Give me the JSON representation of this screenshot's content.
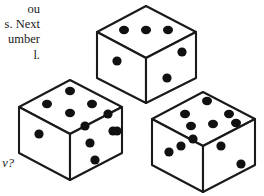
{
  "page": {
    "background_color": "#ffffff",
    "width": 264,
    "height": 196,
    "ink_color": "#1a1a1a",
    "pip_color": "#111111"
  },
  "text": {
    "paragraph_lines": [
      "ou",
      "s. Next",
      "umber",
      "l."
    ],
    "question_fragment": "v?"
  },
  "dice": [
    {
      "id": "die-top",
      "position": "top-center",
      "faces": {
        "top": {
          "pips": 3,
          "arrangement": "row-of-three"
        },
        "left": {
          "pips": 1,
          "arrangement": "center"
        },
        "right": {
          "pips": 2,
          "arrangement": "diagonal"
        }
      }
    },
    {
      "id": "die-left",
      "position": "bottom-left",
      "faces": {
        "top": {
          "pips": 5,
          "arrangement": "quincunx"
        },
        "left": {
          "pips": 1,
          "arrangement": "center"
        },
        "right": {
          "pips": 6,
          "arrangement": "two-columns-of-three"
        }
      }
    },
    {
      "id": "die-right",
      "position": "bottom-right",
      "faces": {
        "top": {
          "pips": 6,
          "arrangement": "two-rows-of-three"
        },
        "left": {
          "pips": 3,
          "arrangement": "diagonal"
        },
        "right": {
          "pips": 2,
          "arrangement": "diagonal"
        }
      }
    }
  ],
  "geometry": {
    "die_top": {
      "top_face": "146,6 196,32 146,58 97,32",
      "left_face": "97,32 146,58 146,103 97,78",
      "right_face": "146,58 196,32 196,78 146,103",
      "top_pips": [
        [
          124,
          30
        ],
        [
          146,
          30
        ],
        [
          168,
          30
        ]
      ],
      "left_pips": [
        [
          116,
          60
        ]
      ],
      "right_pips": [
        [
          181,
          52
        ],
        [
          167,
          77
        ]
      ]
    },
    "die_left": {
      "top_face": "70,80 122,107 70,134 19,107",
      "left_face": "19,107 70,134 70,180 19,153",
      "right_face": "70,134 122,107 122,153 70,180",
      "top_pips": [
        [
          70,
          91
        ],
        [
          48,
          104
        ],
        [
          92,
          104
        ],
        [
          70,
          117
        ],
        [
          48,
          117
        ]
      ],
      "left_pips": [
        [
          39,
          133
        ]
      ],
      "right_pips": [
        [
          84,
          126
        ],
        [
          107,
          115
        ],
        [
          89,
          143
        ],
        [
          112,
          132
        ],
        [
          94,
          160
        ],
        [
          117,
          149
        ]
      ]
    },
    "die_right": {
      "top_face": "203,92 255,119 203,146 152,119]",
      "left_face": "152,119 203,146 203,192 152,165",
      "right_face": "203,146 255,119 255,165 203,192",
      "top_pips": [
        [
          206,
          100
        ],
        [
          184,
          113
        ],
        [
          228,
          113
        ],
        [
          213,
          124
        ],
        [
          191,
          137
        ],
        [
          235,
          124
        ]
      ],
      "left_pips": [
        [
          171,
          149
        ],
        [
          182,
          143
        ],
        [
          193,
          137
        ]
      ],
      "right_pips": [
        [
          221,
          146
        ],
        [
          240,
          163
        ]
      ]
    }
  }
}
